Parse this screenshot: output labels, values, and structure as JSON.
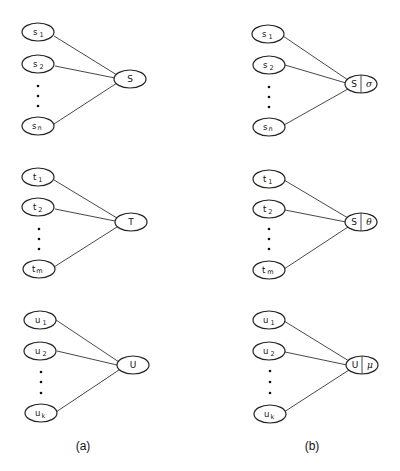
{
  "panels": [
    {
      "id": "a",
      "caption": "(a)",
      "groups": [
        {
          "inputs": [
            {
              "base": "s",
              "sub": "1"
            },
            {
              "base": "s",
              "sub": "2"
            },
            {
              "base": "s",
              "sub": "n"
            }
          ],
          "target": {
            "label": "S"
          }
        },
        {
          "inputs": [
            {
              "base": "t",
              "sub": "1"
            },
            {
              "base": "t",
              "sub": "2"
            },
            {
              "base": "t",
              "sub": "m"
            }
          ],
          "target": {
            "label": "T"
          }
        },
        {
          "inputs": [
            {
              "base": "u",
              "sub": "1"
            },
            {
              "base": "u",
              "sub": "2"
            },
            {
              "base": "u",
              "sub": "k"
            }
          ],
          "target": {
            "label": "U"
          }
        }
      ]
    },
    {
      "id": "b",
      "caption": "(b)",
      "groups": [
        {
          "inputs": [
            {
              "base": "s",
              "sub": "1"
            },
            {
              "base": "s",
              "sub": "2"
            },
            {
              "base": "s",
              "sub": "n"
            }
          ],
          "target": {
            "label": "S",
            "annotation": "σ"
          }
        },
        {
          "inputs": [
            {
              "base": "t",
              "sub": "1"
            },
            {
              "base": "t",
              "sub": "2"
            },
            {
              "base": "t",
              "sub": "m"
            }
          ],
          "target": {
            "label": "S",
            "annotation": "θ"
          }
        },
        {
          "inputs": [
            {
              "base": "u",
              "sub": "1"
            },
            {
              "base": "u",
              "sub": "2"
            },
            {
              "base": "u",
              "sub": "k"
            }
          ],
          "target": {
            "label": "U",
            "annotation": "μ"
          }
        }
      ]
    }
  ],
  "ellipsis": "⋮"
}
